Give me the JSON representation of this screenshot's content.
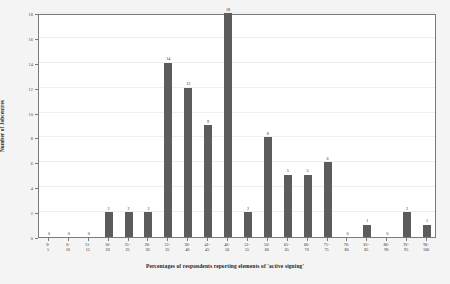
{
  "chart_data": {
    "type": "bar",
    "title": "",
    "xlabel": "Percentages of respondents reporting elements of 'active signing'",
    "ylabel": "Number of Jobcentres",
    "categories": [
      "0-5",
      "6-10",
      "11-15",
      "16-20",
      "21-25",
      "26-30",
      "31-35",
      "36-40",
      "41-45",
      "46-50",
      "51-55",
      "56-60",
      "61-65",
      "66-70",
      "71-75",
      "76-80",
      "81-85",
      "86-90",
      "91-95",
      "96-100"
    ],
    "category_lines": [
      [
        "0-",
        "5"
      ],
      [
        "6-",
        "10"
      ],
      [
        "11-",
        "15"
      ],
      [
        "16-",
        "20"
      ],
      [
        "21-",
        "25"
      ],
      [
        "26-",
        "30"
      ],
      [
        "31-",
        "35"
      ],
      [
        "36-",
        "40"
      ],
      [
        "41-",
        "45"
      ],
      [
        "46-",
        "50"
      ],
      [
        "51-",
        "55"
      ],
      [
        "56-",
        "60"
      ],
      [
        "61-",
        "65"
      ],
      [
        "66-",
        "70"
      ],
      [
        "71-",
        "75"
      ],
      [
        "76-",
        "80"
      ],
      [
        "81-",
        "85"
      ],
      [
        "86-",
        "90"
      ],
      [
        "91-",
        "95"
      ],
      [
        "96-",
        "100"
      ]
    ],
    "values": [
      0,
      0,
      0,
      2,
      2,
      2,
      14,
      12,
      9,
      18,
      2,
      8,
      5,
      5,
      6,
      0,
      1,
      0,
      2,
      1
    ],
    "ylim": [
      0,
      18
    ],
    "y_ticks": [
      0,
      2,
      4,
      6,
      8,
      10,
      12,
      14,
      16,
      18
    ],
    "grid": true,
    "legend": "none",
    "bar_color": "#5c5c5c",
    "plot_background": "#ffffff",
    "figure_background": "#f4f4f4"
  }
}
